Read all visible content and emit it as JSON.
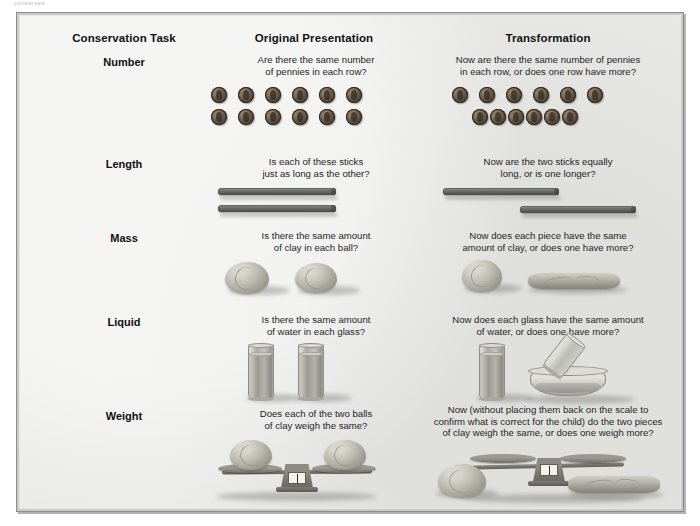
{
  "top_caption": "conserves",
  "headers": {
    "task": "Conservation Task",
    "original": "Original Presentation",
    "transformation": "Transformation"
  },
  "rows": [
    {
      "label": "Number",
      "original_question": "Are there the same number\nof pennies in each row?",
      "transformation_question": "Now are there the same number of pennies\nin each row, or does one row have more?",
      "original_art": "two-aligned-rows-of-six-pennies",
      "transformation_art": "spread-row-and-compressed-row-of-six-pennies",
      "penny_count_per_row": 6,
      "row_count": 2
    },
    {
      "label": "Length",
      "original_question": "Is each of these sticks\njust as long as the other?",
      "transformation_question": "Now are the two sticks equally\nlong, or is one longer?",
      "original_art": "two-aligned-sticks",
      "transformation_art": "two-staggered-offset-sticks",
      "stick_count": 2
    },
    {
      "label": "Mass",
      "original_question": "Is there the same amount\nof clay in each ball?",
      "transformation_question": "Now does each piece have the same\namount of clay, or does one have more?",
      "original_art": "two-clay-balls",
      "transformation_art": "one-clay-ball-and-one-flattened-clay-snake"
    },
    {
      "label": "Liquid",
      "original_question": "Is there the same amount\nof water in each glass?",
      "transformation_question": "Now does each glass have the same amount\nof water, or does one have more?",
      "original_art": "two-identical-tall-glasses-of-water",
      "transformation_art": "tall-glass-and-tilted-glass-pouring-into-wide-bowl"
    },
    {
      "label": "Weight",
      "original_question": "Does each of the two balls\nof clay weigh the same?",
      "transformation_question": "Now (without placing them back on the scale to\nconfirm what is correct for the child) do the two pieces\nof clay weigh the same, or does one weigh more?",
      "original_art": "balance-scale-with-two-clay-balls-on-pans",
      "transformation_art": "empty-balance-scale-with-clay-ball-left-and-flattened-clay-right"
    }
  ],
  "colors": {
    "paper_background": "#e8e8e6",
    "frame_border": "#8d8d8d",
    "text": "#1a1a1a",
    "penny": "#6d5c49",
    "stick": "#6e7268",
    "clay": "#bdbdb3",
    "glass": "#a8a8a2"
  }
}
